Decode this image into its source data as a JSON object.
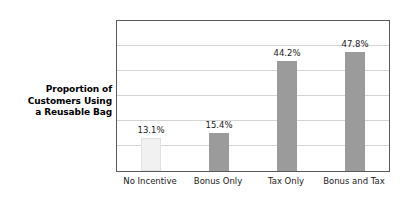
{
  "chart_data": {
    "type": "bar",
    "title": "",
    "xlabel": "",
    "ylabel": "Proportion of Customers Using a Reusable Bag",
    "ylabel_lines": [
      "Proportion of",
      "Customers Using",
      "a Reusable Bag"
    ],
    "categories": [
      "No Incentive",
      "Bonus Only",
      "Tax Only",
      "Bonus and Tax"
    ],
    "values": [
      13.1,
      15.4,
      44.2,
      47.8
    ],
    "value_labels": [
      "13.1%",
      "15.4%",
      "44.2%",
      "47.8%"
    ],
    "ylim": [
      0,
      60
    ],
    "grid": true,
    "gridlines": [
      10,
      20,
      30,
      40,
      50
    ],
    "legend": "none",
    "bar_colors": [
      "#f1f1f1",
      "#9b9b9b",
      "#9b9b9b",
      "#9b9b9b"
    ],
    "axis_color": "#5a5a5a",
    "gridline_color": "#d4d4d4",
    "background": "#ffffff"
  }
}
